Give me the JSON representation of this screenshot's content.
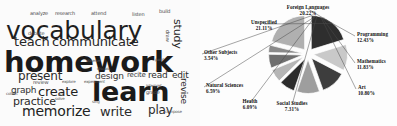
{
  "wordcloud": {
    "name": "educational-activity-word-cloud",
    "words": [
      {
        "text": "vocabulary",
        "size": 25,
        "x": 6,
        "y": 18,
        "weight": 400,
        "color": "#1f1f1f",
        "rot": 0
      },
      {
        "text": "homework",
        "size": 29,
        "x": 4,
        "y": 48,
        "weight": 700,
        "color": "#1a1a1a",
        "rot": 0
      },
      {
        "text": "learn",
        "size": 27,
        "x": 92,
        "y": 78,
        "weight": 700,
        "color": "#1a1a1a",
        "rot": 0
      },
      {
        "text": "communicate",
        "size": 13,
        "x": 52,
        "y": 35,
        "weight": 400,
        "color": "#262626",
        "rot": 0
      },
      {
        "text": "teach",
        "size": 13,
        "x": 14,
        "y": 35,
        "weight": 400,
        "color": "#262626",
        "rot": 0
      },
      {
        "text": "memorize",
        "size": 14,
        "x": 22,
        "y": 104,
        "weight": 400,
        "color": "#222",
        "rot": 0
      },
      {
        "text": "write",
        "size": 13,
        "x": 100,
        "y": 105,
        "weight": 400,
        "color": "#2b2b2b",
        "rot": 0
      },
      {
        "text": "present",
        "size": 12,
        "x": 18,
        "y": 70,
        "weight": 400,
        "color": "#2b2b2b",
        "rot": 0
      },
      {
        "text": "create",
        "size": 13,
        "x": 38,
        "y": 85,
        "weight": 400,
        "color": "#1f1f1f",
        "rot": 0
      },
      {
        "text": "practice",
        "size": 11,
        "x": 13,
        "y": 96,
        "weight": 400,
        "color": "#2b2b2b",
        "rot": 0
      },
      {
        "text": "graph",
        "size": 9,
        "x": 11,
        "y": 86,
        "weight": 400,
        "color": "#303030",
        "rot": 0
      },
      {
        "text": "play",
        "size": 12,
        "x": 148,
        "y": 104,
        "weight": 400,
        "color": "#2b2b2b",
        "rot": 0
      },
      {
        "text": "design",
        "size": 9,
        "x": 95,
        "y": 72,
        "weight": 400,
        "color": "#333",
        "rot": 0
      },
      {
        "text": "read",
        "size": 9,
        "x": 148,
        "y": 71,
        "weight": 400,
        "color": "#2b2b2b",
        "rot": 0
      },
      {
        "text": "edit",
        "size": 9,
        "x": 172,
        "y": 71,
        "weight": 400,
        "color": "#2b2b2b",
        "rot": 0
      },
      {
        "text": "recite",
        "size": 7,
        "x": 127,
        "y": 72,
        "weight": 400,
        "color": "#3a3a3a",
        "rot": 0
      },
      {
        "text": "analyze",
        "size": 5,
        "x": 30,
        "y": 11,
        "weight": 400,
        "color": "#4a4a4a",
        "rot": 0
      },
      {
        "text": "research",
        "size": 5,
        "x": 55,
        "y": 11,
        "weight": 400,
        "color": "#4a4a4a",
        "rot": 0
      },
      {
        "text": "attend",
        "size": 5,
        "x": 91,
        "y": 11,
        "weight": 400,
        "color": "#4a4a4a",
        "rot": 0
      },
      {
        "text": "listen",
        "size": 5,
        "x": 132,
        "y": 12,
        "weight": 400,
        "color": "#4a4a4a",
        "rot": 0
      },
      {
        "text": "build",
        "size": 5,
        "x": 159,
        "y": 9,
        "weight": 400,
        "color": "#4a4a4a",
        "rot": 0
      },
      {
        "text": "debate",
        "size": 5,
        "x": 28,
        "y": 31,
        "weight": 400,
        "color": "#4a4a4a",
        "rot": 0
      },
      {
        "text": "review",
        "size": 5,
        "x": 33,
        "y": 80,
        "weight": 400,
        "color": "#4a4a4a",
        "rot": 0
      },
      {
        "text": "explore",
        "size": 4,
        "x": 62,
        "y": 80,
        "weight": 400,
        "color": "#555",
        "rot": 0
      },
      {
        "text": "experiment",
        "size": 4,
        "x": 84,
        "y": 80,
        "weight": 400,
        "color": "#555",
        "rot": 0
      },
      {
        "text": "act",
        "size": 4,
        "x": 58,
        "y": 93,
        "weight": 400,
        "color": "#555",
        "rot": 0
      },
      {
        "text": "solve",
        "size": 4,
        "x": 55,
        "y": 97,
        "weight": 400,
        "color": "#555",
        "rot": 0
      },
      {
        "text": "grade",
        "size": 5,
        "x": 146,
        "y": 90,
        "weight": 400,
        "color": "#4a4a4a",
        "rot": 0
      },
      {
        "text": "interpret",
        "size": 4,
        "x": 146,
        "y": 84,
        "weight": 400,
        "color": "#555",
        "rot": 0
      },
      {
        "text": "paint",
        "size": 4,
        "x": 155,
        "y": 58,
        "weight": 400,
        "color": "#555",
        "rot": 0
      },
      {
        "text": "discuss",
        "size": 4,
        "x": 97,
        "y": 67,
        "weight": 400,
        "color": "#555",
        "rot": 0
      },
      {
        "text": "collect",
        "size": 4,
        "x": 6,
        "y": 92,
        "weight": 400,
        "color": "#555",
        "rot": 0
      },
      {
        "text": "observe",
        "size": 4,
        "x": 86,
        "y": 59,
        "weight": 400,
        "color": "#555",
        "rot": 0
      },
      {
        "text": "sing",
        "size": 4,
        "x": 92,
        "y": 100,
        "weight": 400,
        "color": "#555",
        "rot": 0
      },
      {
        "text": "study",
        "size": 11,
        "x": 183,
        "y": 19,
        "weight": 400,
        "color": "#262626",
        "rot": 90
      },
      {
        "text": "revise",
        "size": 9,
        "x": 188,
        "y": 78,
        "weight": 400,
        "color": "#2b2b2b",
        "rot": 90
      },
      {
        "text": "draw",
        "size": 5,
        "x": 170,
        "y": 30,
        "weight": 400,
        "color": "#4a4a4a",
        "rot": 90
      },
      {
        "text": "compose",
        "size": 4,
        "x": 165,
        "y": 110,
        "weight": 400,
        "color": "#555",
        "rot": 0
      }
    ]
  },
  "chart_data": {
    "type": "pie",
    "title": "",
    "legend_position": "outside-labels",
    "exploded": true,
    "start_angle_deg": 90,
    "direction": "clockwise",
    "center": {
      "x": 108,
      "y": 54
    },
    "radius": 34,
    "categories": [
      "Foreign Languages",
      "Programming",
      "Mathematics",
      "Art",
      "Social Studies",
      "Health",
      "Natural Sciences",
      "Other Subjects",
      "Unspecified"
    ],
    "values": [
      20.22,
      12.43,
      11.83,
      10.8,
      7.31,
      6.09,
      6.59,
      3.54,
      21.11
    ],
    "labels": [
      {
        "name": "Foreign Languages",
        "pct": "20.22%",
        "color": "#2e2e2e",
        "lx": 108,
        "ly": 4,
        "anchor": "center"
      },
      {
        "name": "Programming",
        "pct": "12.43%",
        "color": "#c9c9c9",
        "lx": 157,
        "ly": 31,
        "anchor": "left"
      },
      {
        "name": "Mathematics",
        "pct": "11.83%",
        "color": "#3d3d3d",
        "lx": 157,
        "ly": 58,
        "anchor": "left"
      },
      {
        "name": "Art",
        "pct": "10.80%",
        "color": "#9e9e9e",
        "lx": 158,
        "ly": 84,
        "anchor": "left"
      },
      {
        "name": "Social Studies",
        "pct": "7.31%",
        "color": "#2b2b2b",
        "lx": 92,
        "ly": 100,
        "anchor": "center"
      },
      {
        "name": "Health",
        "pct": "6.09%",
        "color": "#b5b5b5",
        "lx": 50,
        "ly": 98,
        "anchor": "center"
      },
      {
        "name": "Natural Sciences",
        "pct": "6.59%",
        "color": "#6f6f6f",
        "lx": 6,
        "ly": 82,
        "anchor": "left"
      },
      {
        "name": "Other Subjects",
        "pct": "3.54%",
        "color": "#8a8a8a",
        "lx": 4,
        "ly": 49,
        "anchor": "left"
      },
      {
        "name": "Unspecified",
        "pct": "21.11%",
        "color": "#b0b0b0",
        "lx": 64,
        "ly": 19,
        "anchor": "center"
      }
    ],
    "xlabel": "",
    "ylabel": ""
  }
}
